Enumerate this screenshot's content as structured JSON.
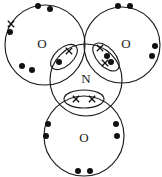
{
  "figure": {
    "width": 162,
    "height": 177,
    "background_color": "#ffffff",
    "line_color": "#1a1a1a",
    "electron_color": "#111111"
  },
  "chart_data": {
    "type": "diagram",
    "central_atom": "N",
    "outer_atoms": [
      "O",
      "O",
      "O"
    ],
    "dot_symbol": "filled-circle",
    "cross_symbol": "x",
    "atoms": [
      {
        "id": "oxygen-left",
        "label": "O",
        "cx": 45,
        "cy": 45,
        "r": 40,
        "label_x": 42,
        "label_y": 45
      },
      {
        "id": "nitrogen-center",
        "label": "N",
        "cx": 86,
        "cy": 80,
        "r": 36,
        "label_x": 86,
        "label_y": 80
      },
      {
        "id": "oxygen-right",
        "label": "O",
        "cx": 122,
        "cy": 45,
        "r": 38,
        "label_x": 126,
        "label_y": 45
      },
      {
        "id": "oxygen-bottom",
        "label": "O",
        "cx": 84,
        "cy": 136,
        "r": 40,
        "label_x": 84,
        "label_y": 139
      }
    ],
    "bonds": [
      {
        "id": "bond-n-o-left",
        "between": [
          "N",
          "O-left"
        ],
        "type": "single",
        "dots": 1,
        "crosses": 1,
        "lens_cx": 64,
        "lens_cy": 57,
        "lens_rx": 16,
        "lens_ry": 9,
        "lens_rotation": -42
      },
      {
        "id": "bond-n-o-right",
        "between": [
          "N",
          "O-right"
        ],
        "type": "double",
        "dots": 2,
        "crosses": 2,
        "lens_cx": 106,
        "lens_cy": 57,
        "lens_rx": 17,
        "lens_ry": 9,
        "lens_rotation": 48
      },
      {
        "id": "bond-n-o-bottom",
        "between": [
          "N",
          "O-bottom"
        ],
        "type": "dative",
        "dots": 0,
        "crosses": 2,
        "lens_cx": 84,
        "lens_cy": 99,
        "lens_rx": 20,
        "lens_ry": 9,
        "lens_rotation": 0
      }
    ],
    "lone_electrons": {
      "oxygen-left": {
        "dots": 5,
        "crosses": 1,
        "note": "one cross at upper-left, two dots top, one dot left, two dots lower-left"
      },
      "oxygen-right": {
        "dots": 4,
        "crosses": 0,
        "note": "two dots top, two dots right edge"
      },
      "oxygen-bottom": {
        "dots": 6,
        "crosses": 0,
        "note": "two dots left, two dots bottom, two dots right"
      }
    }
  },
  "electrons": {
    "oxygen_left_dots": [
      {
        "x": 38,
        "y": 6
      },
      {
        "x": 50,
        "y": 9
      },
      {
        "x": 10,
        "y": 32
      },
      {
        "x": 22,
        "y": 66
      },
      {
        "x": 32,
        "y": 70
      }
    ],
    "oxygen_left_crosses": [
      {
        "x": 11,
        "y": 24
      }
    ],
    "oxygen_right_dots": [
      {
        "x": 118,
        "y": 6
      },
      {
        "x": 130,
        "y": 6
      },
      {
        "x": 155,
        "y": 46
      },
      {
        "x": 152,
        "y": 56
      }
    ],
    "oxygen_right_crosses": [],
    "oxygen_bottom_dots": [
      {
        "x": 48,
        "y": 124
      },
      {
        "x": 46,
        "y": 136
      },
      {
        "x": 78,
        "y": 171
      },
      {
        "x": 90,
        "y": 171
      },
      {
        "x": 116,
        "y": 124
      },
      {
        "x": 117,
        "y": 136
      }
    ],
    "oxygen_bottom_crosses": [],
    "bond_left_dots": [
      {
        "x": 59,
        "y": 62
      }
    ],
    "bond_left_crosses": [
      {
        "x": 69,
        "y": 51
      }
    ],
    "bond_right_dots": [
      {
        "x": 107,
        "y": 56
      },
      {
        "x": 111,
        "y": 62
      }
    ],
    "bond_right_crosses": [
      {
        "x": 100,
        "y": 48
      },
      {
        "x": 105,
        "y": 63
      }
    ],
    "bond_bottom_dots": [],
    "bond_bottom_crosses": [
      {
        "x": 76,
        "y": 99
      },
      {
        "x": 92,
        "y": 99
      }
    ]
  }
}
